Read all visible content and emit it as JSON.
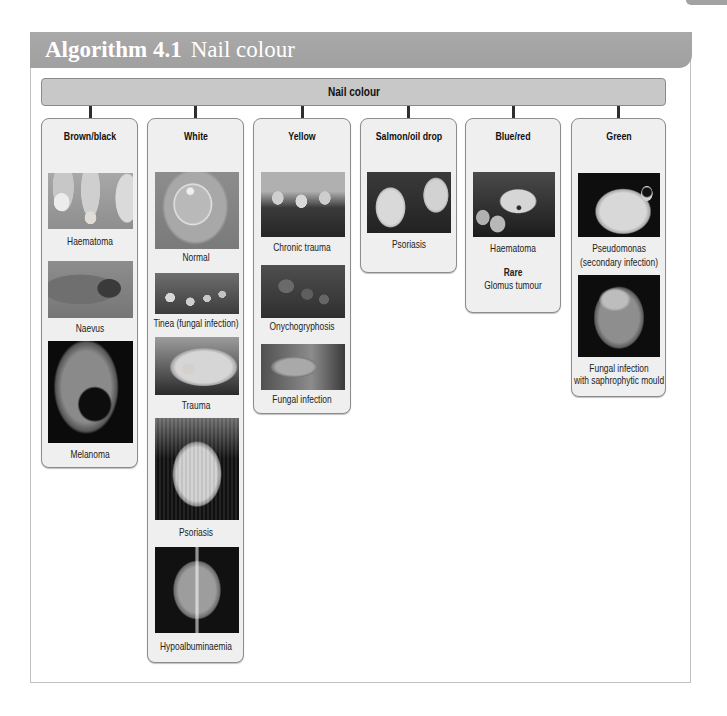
{
  "header": {
    "title_bold": "Algorithm 4.1",
    "title_rest": "Nail colour"
  },
  "root": {
    "label": "Nail colour"
  },
  "categories": [
    {
      "title": "Brown/black",
      "items": [
        {
          "caption": "Haematoma"
        },
        {
          "caption": "Naevus"
        },
        {
          "caption": "Melanoma"
        }
      ]
    },
    {
      "title": "White",
      "items": [
        {
          "caption": "Normal"
        },
        {
          "caption": "Tinea (fungal infection)"
        },
        {
          "caption": "Trauma"
        },
        {
          "caption": "Psoriasis"
        },
        {
          "caption": "Hypoalbuminaemia"
        }
      ]
    },
    {
      "title": "Yellow",
      "items": [
        {
          "caption": "Chronic trauma"
        },
        {
          "caption": "Onychogryphosis"
        },
        {
          "caption": "Fungal infection"
        }
      ]
    },
    {
      "title": "Salmon/oil drop",
      "items": [
        {
          "caption": "Psoriasis"
        }
      ]
    },
    {
      "title": "Blue/red",
      "items": [
        {
          "caption": "Haematoma"
        }
      ],
      "rare_label": "Rare",
      "rare_items": [
        "Glomus tumour"
      ]
    },
    {
      "title": "Green",
      "items": [
        {
          "caption_lines": [
            "Pseudomonas",
            "(secondary infection)"
          ]
        },
        {
          "caption_lines": [
            "Fungal infection",
            "with saphrophytic mould"
          ]
        }
      ]
    }
  ],
  "colors": {
    "banner_bg": "#a4a4a4",
    "banner_text": "#ffffff",
    "root_bar_bg": "#c8c8c8",
    "card_bg": "#efefef",
    "card_border": "#8c8c8c",
    "connector": "#2e2e2e"
  }
}
